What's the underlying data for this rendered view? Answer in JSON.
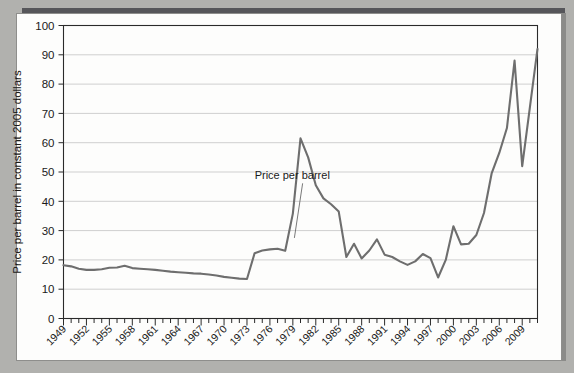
{
  "figure": {
    "background_color": "#b1b1ae",
    "card_color": "#fdfdfc",
    "shadow_color": "#56565a"
  },
  "chart_data": {
    "type": "line",
    "title": "",
    "xlabel": "",
    "ylabel": "Price per barrel in constant 2005 dollars",
    "ylim": [
      0,
      100
    ],
    "xlim": [
      1949,
      2011
    ],
    "grid": "horizontal",
    "legend": "none",
    "line_color": "#6e6e6e",
    "ytick_labels": [
      "0",
      "10",
      "20",
      "30",
      "40",
      "50",
      "60",
      "70",
      "80",
      "90",
      "100"
    ],
    "ytick_values": [
      0,
      10,
      20,
      30,
      40,
      50,
      60,
      70,
      80,
      90,
      100
    ],
    "xtick_labels": [
      "1949",
      "1952",
      "1955",
      "1958",
      "1961",
      "1964",
      "1967",
      "1970",
      "1973",
      "1976",
      "1979",
      "1982",
      "1985",
      "1988",
      "1991",
      "1994",
      "1997",
      "2000",
      "2003",
      "2006",
      "2009"
    ],
    "xtick_values": [
      1949,
      1952,
      1955,
      1958,
      1961,
      1964,
      1967,
      1970,
      1973,
      1976,
      1979,
      1982,
      1985,
      1988,
      1991,
      1994,
      1997,
      2000,
      2003,
      2006,
      2009
    ],
    "minor_tick_interval": 1,
    "annotations": [
      {
        "text": "Price per barrel",
        "label_x": 1974.0,
        "label_y": 47.5,
        "point_x": 1979.2,
        "point_y": 27.5
      }
    ],
    "series": [
      {
        "name": "Price per barrel",
        "x": [
          1949,
          1950,
          1951,
          1952,
          1953,
          1954,
          1955,
          1956,
          1957,
          1958,
          1959,
          1960,
          1961,
          1962,
          1963,
          1964,
          1965,
          1966,
          1967,
          1968,
          1969,
          1970,
          1971,
          1972,
          1973,
          1974,
          1975,
          1976,
          1977,
          1978,
          1979,
          1980,
          1981,
          1982,
          1983,
          1984,
          1985,
          1986,
          1987,
          1988,
          1989,
          1990,
          1991,
          1992,
          1993,
          1994,
          1995,
          1996,
          1997,
          1998,
          1999,
          2000,
          2001,
          2002,
          2003,
          2004,
          2005,
          2006,
          2007,
          2008,
          2009,
          2010,
          2011
        ],
        "values": [
          18.2,
          17.8,
          17.0,
          16.6,
          16.6,
          16.8,
          17.3,
          17.4,
          18.0,
          17.2,
          17.0,
          16.8,
          16.6,
          16.3,
          16.0,
          15.8,
          15.6,
          15.4,
          15.3,
          15.0,
          14.7,
          14.2,
          13.9,
          13.6,
          13.5,
          22.3,
          23.2,
          23.6,
          23.8,
          23.1,
          35.8,
          61.5,
          55.0,
          45.5,
          41.0,
          39.0,
          36.5,
          21.0,
          25.5,
          20.5,
          23.2,
          27.0,
          21.8,
          21.0,
          19.5,
          18.3,
          19.5,
          22.0,
          20.6,
          14.0,
          20.0,
          31.5,
          25.3,
          25.5,
          28.5,
          36.0,
          49.5,
          56.5,
          65.0,
          88.0,
          52.0,
          72.0,
          92.0
        ]
      }
    ]
  }
}
